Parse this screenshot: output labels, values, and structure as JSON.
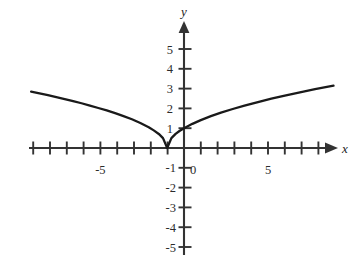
{
  "chart_data": {
    "type": "line",
    "title": "",
    "subtitle": "",
    "xlabel": "x",
    "ylabel": "y",
    "xlim": [
      -9.6,
      9.6
    ],
    "ylim": [
      -5.6,
      6.0
    ],
    "grid": false,
    "legend": null,
    "annotations": [],
    "axis_style": {
      "arrows": [
        "x-positive",
        "y-positive"
      ],
      "tick_interval_x": 1,
      "tick_interval_y": 1,
      "labeled_x_ticks": [
        -5,
        0,
        5
      ],
      "labeled_y_ticks": [
        5,
        4,
        3,
        2,
        1,
        -1,
        -2,
        -3,
        -4,
        -5
      ],
      "line_color": "#333333",
      "curve_color": "#1a1a1a"
    },
    "x_tick_labels": [
      "-5",
      "0",
      "5"
    ],
    "y_tick_labels": [
      "5",
      "4",
      "3",
      "2",
      "1",
      "-1",
      "-2",
      "-3",
      "-4",
      "-5"
    ],
    "series": [
      {
        "name": "y = sqrt(|x + 1|)",
        "vertex": [
          -1,
          0
        ],
        "y_intercept": [
          0,
          1
        ],
        "x": [
          -9.1,
          -8.6,
          -8.1,
          -7.6,
          -7.1,
          -6.6,
          -6.1,
          -5.6,
          -5.1,
          -4.6,
          -4.1,
          -3.6,
          -3.1,
          -2.6,
          -2.1,
          -1.8,
          -1.5,
          -1.25,
          -1.0,
          -0.75,
          -0.5,
          -0.25,
          0.0,
          0.5,
          1.0,
          1.6,
          2.2,
          2.9,
          3.6,
          4.4,
          5.2,
          6.0,
          6.9,
          7.8,
          8.9
        ],
        "y": [
          2.85,
          2.76,
          2.67,
          2.57,
          2.47,
          2.37,
          2.26,
          2.14,
          2.02,
          1.9,
          1.76,
          1.61,
          1.45,
          1.26,
          1.05,
          0.89,
          0.71,
          0.5,
          0.0,
          0.5,
          0.71,
          0.87,
          1.0,
          1.22,
          1.41,
          1.61,
          1.79,
          1.97,
          2.14,
          2.32,
          2.49,
          2.65,
          2.81,
          2.97,
          3.15
        ]
      }
    ]
  },
  "figure": {
    "axis_x_name": "x",
    "axis_y_name": "y"
  }
}
